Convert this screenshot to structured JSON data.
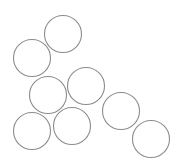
{
  "canvas": {
    "width": 183,
    "height": 168,
    "background": "#ffffff"
  },
  "style": {
    "stroke": "#8c8c8c",
    "stroke_width": 1.1,
    "fill": "none"
  },
  "circles": [
    {
      "cx": 63,
      "cy": 34,
      "r": 18.5
    },
    {
      "cx": 32,
      "cy": 58,
      "r": 18.5
    },
    {
      "cx": 48,
      "cy": 95,
      "r": 18.5
    },
    {
      "cx": 86,
      "cy": 86,
      "r": 18.5
    },
    {
      "cx": 32,
      "cy": 131,
      "r": 18.5
    },
    {
      "cx": 72,
      "cy": 126,
      "r": 18.5
    },
    {
      "cx": 121,
      "cy": 111,
      "r": 18.5
    },
    {
      "cx": 151,
      "cy": 139,
      "r": 18.5
    }
  ]
}
